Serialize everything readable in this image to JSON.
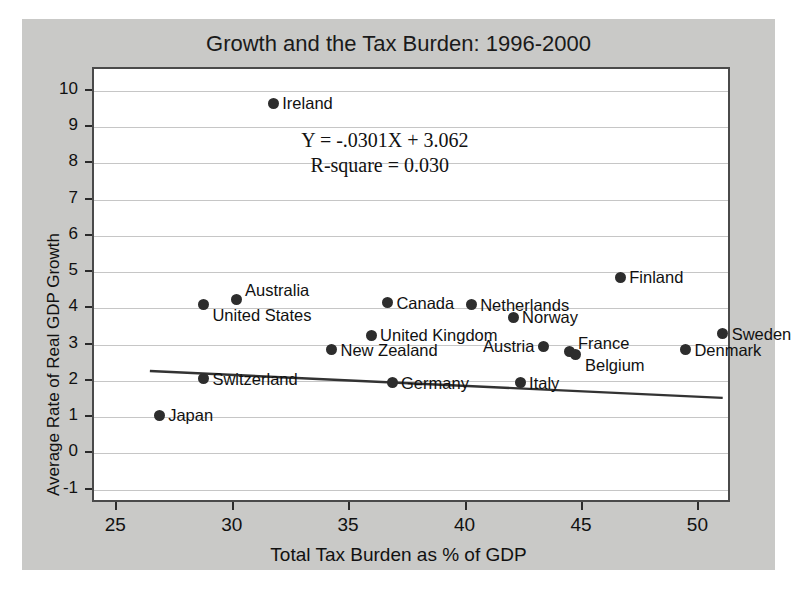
{
  "chart_data": {
    "type": "scatter",
    "title": "Growth and the Tax Burden: 1996-2000",
    "xlabel": "Total Tax Burden as % of GDP",
    "ylabel": "Average Rate of Real GDP Growth",
    "xlim": [
      24.0,
      51.4
    ],
    "ylim": [
      -1.4,
      10.6
    ],
    "xticks": [
      25,
      30,
      35,
      40,
      45,
      50
    ],
    "yticks": [
      -1,
      0,
      1,
      2,
      3,
      4,
      5,
      6,
      7,
      8,
      9,
      10
    ],
    "grid": true,
    "legend": "none",
    "annotations": {
      "equation": "Y = -.0301X + 3.062",
      "r_square": "R-square = 0.030"
    },
    "trendline": {
      "slope": -0.0301,
      "intercept": 3.062,
      "x_start": 26.4,
      "x_end": 51.0,
      "y_start": 2.267,
      "y_end": 1.527
    },
    "point_color": "#2d2d2d",
    "points": [
      {
        "label": "Ireland",
        "x": 31.7,
        "y": 9.65,
        "label_pos": "right"
      },
      {
        "label": "Finland",
        "x": 46.6,
        "y": 4.85,
        "label_pos": "right"
      },
      {
        "label": "Australia",
        "x": 30.1,
        "y": 4.25,
        "label_pos": "above-right"
      },
      {
        "label": "United States",
        "x": 28.7,
        "y": 4.1,
        "label_pos": "below-right"
      },
      {
        "label": "Canada",
        "x": 36.6,
        "y": 4.15,
        "label_pos": "right"
      },
      {
        "label": "Netherlands",
        "x": 40.2,
        "y": 4.1,
        "label_pos": "right"
      },
      {
        "label": "Norway",
        "x": 42.0,
        "y": 3.75,
        "label_pos": "right"
      },
      {
        "label": "Sweden",
        "x": 51.0,
        "y": 3.3,
        "label_pos": "right"
      },
      {
        "label": "United Kingdom",
        "x": 35.9,
        "y": 3.25,
        "label_pos": "right"
      },
      {
        "label": "New Zealand",
        "x": 34.2,
        "y": 2.85,
        "label_pos": "right"
      },
      {
        "label": "Austria",
        "x": 43.3,
        "y": 2.95,
        "label_pos": "left"
      },
      {
        "label": "France",
        "x": 44.4,
        "y": 2.8,
        "label_pos": "above-right"
      },
      {
        "label": "Belgium",
        "x": 44.7,
        "y": 2.72,
        "label_pos": "below-right"
      },
      {
        "label": "Denmark",
        "x": 49.4,
        "y": 2.85,
        "label_pos": "right"
      },
      {
        "label": "Switzerland",
        "x": 28.7,
        "y": 2.05,
        "label_pos": "right"
      },
      {
        "label": "Germany",
        "x": 36.8,
        "y": 1.95,
        "label_pos": "right"
      },
      {
        "label": "Italy",
        "x": 42.3,
        "y": 1.95,
        "label_pos": "right"
      },
      {
        "label": "Japan",
        "x": 26.8,
        "y": 1.05,
        "label_pos": "right"
      }
    ]
  }
}
